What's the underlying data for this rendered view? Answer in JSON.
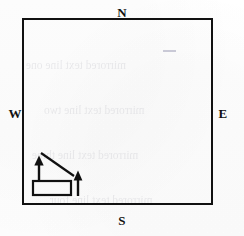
{
  "figure": {
    "type": "compass-oriented-diagram",
    "canvas": {
      "width": 244,
      "height": 236,
      "background": "#fefefe"
    },
    "ink_color": "#111111",
    "boundary": {
      "name": "main-square",
      "shape": "rectangle",
      "x": 22,
      "y": 18,
      "width": 191,
      "height": 187,
      "stroke_width": 2,
      "fill": "none"
    },
    "compass": {
      "north": "N",
      "south": "S",
      "east": "E",
      "west": "W"
    },
    "diagram": {
      "rectangle": {
        "x": 33,
        "y": 181,
        "width": 38,
        "height": 14,
        "stroke_width": 2,
        "fill": "none"
      },
      "left_arrow": {
        "tip_x": 39,
        "tip_y": 157,
        "tail_x": 39,
        "tail_y": 181,
        "direction": "up"
      },
      "right_arrow": {
        "tip_x": 78,
        "tip_y": 172,
        "tail_x": 78,
        "tail_y": 196,
        "direction": "up"
      },
      "diagonal_line": {
        "x1": 41,
        "y1": 153,
        "x2": 74,
        "y2": 176,
        "stroke_width": 2
      }
    },
    "bleed_through": {
      "visible": true,
      "description": "faint mirrored show-through text from reverse side of page",
      "lines": [
        "mirrored text line one",
        "mirrored text line two",
        "mirrored text line three",
        "mirrored text line four",
        "mirrored text line five"
      ]
    }
  }
}
